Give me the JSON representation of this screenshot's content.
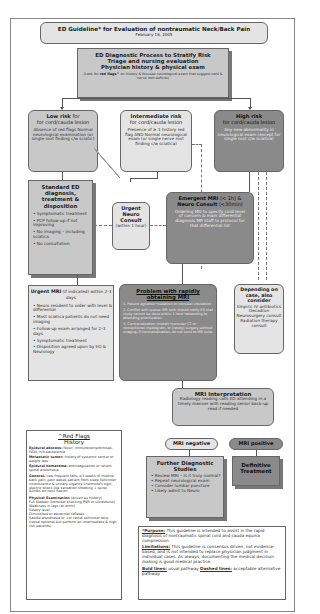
{
  "header": {
    "title": "ED Guideline* for Evaluation of nontraumatic Neck/Back Pain",
    "date": "February 16, 2005"
  },
  "process": {
    "title1": "ED Diagnostic Process to Stratify Risk",
    "title2": "Triage and nursing evaluation",
    "title3": "Physician history & physical exam",
    "note_prefix": "(Look for ",
    "note_bold": "red flags^",
    "note_suffix": " on history & focused neurological exam that suggest cord & nerve root deficits)"
  },
  "low_risk": {
    "title": "Low risk",
    "subtitle": "for cord/cauda lesion",
    "body": "Absence of red flags Normal neurological examination (or single root finding c/w sciatic)"
  },
  "intermediate_risk": {
    "title": "Intermediate risk",
    "subtitle": "for cord/cauda lesion",
    "body": "Presence of ≥ 1 history red flag AND Normal neurological exam (or single nerve root finding c/w sciatica)"
  },
  "high_risk": {
    "title": "High risk",
    "subtitle": "for cord/cauda lesion",
    "body": "Any new abnormality in neurological exam (except for single root c/w sciatica)"
  },
  "standard_ed": {
    "title": "Standard ED diagnosis, treatment & disposition",
    "items": [
      "Symptomatic treatment",
      "PCP follow-up if not improving",
      "No imaging – including sciatica",
      "No consultation"
    ]
  },
  "urgent_neuro": {
    "title": "Urgent Neuro Consult",
    "sub": "(within 1 hour)"
  },
  "emergent": {
    "title_a": "Emergent MRI",
    "title_a_sub": " (< 1h) &",
    "title_b": "Neuro Consult",
    "title_b_sub": " (<30min)",
    "body": "Ordering MD to specify cord level of concern & main differential diagnosis MR staff to protocol for that differential list"
  },
  "urgent_mri": {
    "title": "Urgent MRI",
    "title_sub": " (if indicated) within 2-3 days",
    "items": [
      "Neuro resident to order with level & differential",
      "Most sciatica patients do not need imaging",
      "Follow-up exam arranged for 2-3 days",
      "Symptomatic treatment",
      "Disposition agreed upon by ED & Neurology"
    ]
  },
  "problem": {
    "title": "Problem with rapidly obtaining MRI",
    "items": [
      "1. Patient agitation→sedation or consider intubation",
      "2. Conflict with queue: MR tech should notify ED that study cannot be done within 1 hour→attending to attending prioritization",
      "3. Contraindication (metal)→consider CT or conventional myelogram, or (rarely) surgery without imaging. If contraindication, do not send to MR suite"
    ]
  },
  "depending": {
    "title": "Depending on case, also consider",
    "items": [
      "Empiric IV antibiotics",
      "Decadron",
      "Neurosurgery consult",
      "Radiation therapy consult"
    ]
  },
  "mri_interp": {
    "title": "MRI Interpretation",
    "body": "Radiology reading calls ED attending in a timely manner with reading senior back-up read if needed"
  },
  "mri_negative": {
    "label": "MRI negative"
  },
  "mri_positive": {
    "label": "MRI positive"
  },
  "further": {
    "title": "Further Diagnostic Studies",
    "items": [
      "Review MRI – Is it truly normal?",
      "Repeat neurological exam",
      "Consider lumbar puncture",
      "Likely admit to Neuro"
    ]
  },
  "definitive": {
    "title": "Definitive Treatment"
  },
  "red_flags": {
    "title": "^Red Flags",
    "subtitle": "History",
    "entries": [
      {
        "label": "Epidural abscess:",
        "text": " fever, immunocompromised, IVDA, h/o bacteremia"
      },
      {
        "label": "Metastatic tumor:",
        "text": " history of systemic cancer or weight loss"
      },
      {
        "label": "Epidural hematoma:",
        "text": " anticoagulation or recent spinal anesthesia"
      },
      {
        "label": "General:",
        "text": " new frequent falls, ≥3 weeks of midline back pain, pain wakes patient from sleep Sphincter incontinence & urinary urgency Lhermitte's sign: electric shock-like sensation shooting ↓ spine &limbs on neck flexion"
      }
    ],
    "exam_label": "Physical Examination",
    "exam_sub": " (driven by history)",
    "exam_items": [
      "Full bladder (consider checking PVR or ultrasound)",
      "Weakness in legs (or arms)",
      "Sesory level",
      "Diminished or abnormal reflexes",
      "Saddle anesthesia or ↓or rectal sphincter tone (rectal optional but perform on intermediate & high risk patients)"
    ]
  },
  "notes": {
    "purpose_label": "*Purpose:",
    "purpose_text": " This guideline is intended to assist in the rapid diagnosis of nontraumatic spinal cord and cauda equina compression.",
    "limitations_label": "Limitations:",
    "limitations_text": " This guideline is consensus driven, not evidence-based, and is not intended to replace physician judgment in individual cases. As always, documenting the medical decision making is good medical practice.",
    "bold_label": "Bold lines:",
    "bold_text": " usual pathway ",
    "dashed_label": "Dashed lines:",
    "dashed_text": " acceptable alternative pathway"
  },
  "colors": {
    "light": "#e4e4e4",
    "mid": "#c8c8c8",
    "dark": "#8a8a8a",
    "line": "#555555"
  }
}
